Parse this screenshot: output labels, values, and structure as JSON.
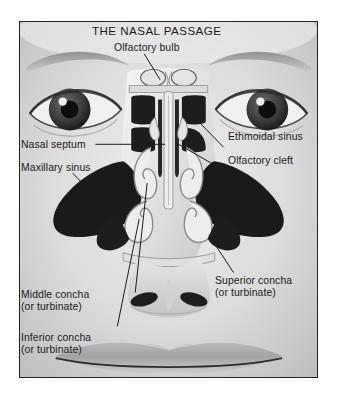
{
  "figure": {
    "title": "THE NASAL PASSAGE",
    "frame_color": "#232323",
    "background_color": "#d9d9d9",
    "label_color": "#1b1b1b",
    "bone_color": "#e8e8e8",
    "cavity_color": "#1d1d1d"
  },
  "labels": [
    {
      "id": "olfactory-bulb",
      "text": "Olfactory bulb",
      "sub": ""
    },
    {
      "id": "ethmoidal-sinus",
      "text": "Ethmoidal sinus",
      "sub": ""
    },
    {
      "id": "olfactory-cleft",
      "text": "Olfactory cleft",
      "sub": ""
    },
    {
      "id": "nasal-septum",
      "text": "Nasal septum",
      "sub": ""
    },
    {
      "id": "maxillary-sinus",
      "text": "Maxillary sinus",
      "sub": ""
    },
    {
      "id": "superior-concha",
      "text": "Superior concha",
      "sub": "(or turbinate)"
    },
    {
      "id": "middle-concha",
      "text": "Middle concha",
      "sub": "(or turbinate)"
    },
    {
      "id": "inferior-concha",
      "text": "Inferior concha",
      "sub": "(or turbinate)"
    }
  ]
}
